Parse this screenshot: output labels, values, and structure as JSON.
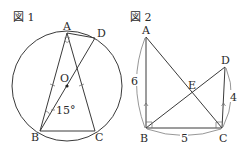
{
  "figure1": {
    "title": "図 1",
    "points": {
      "A": "A",
      "B": "B",
      "C": "C",
      "D": "D",
      "O": "O"
    },
    "angle_label": "15°",
    "description": "Circle with center O; isosceles triangle ABC inscribed (AB = AC marked equal); BD is a diameter through O; chord AD; angle DBA = 15°"
  },
  "figure2": {
    "title": "図 2",
    "points": {
      "A": "A",
      "B": "B",
      "C": "C",
      "D": "D",
      "E": "E"
    },
    "lengths": {
      "AB": "6",
      "BC": "5",
      "CD": "4"
    },
    "description": "AB ⟂ BC, DC ⟂ BC, AB ∥ DC; AC and BD intersect at E"
  }
}
